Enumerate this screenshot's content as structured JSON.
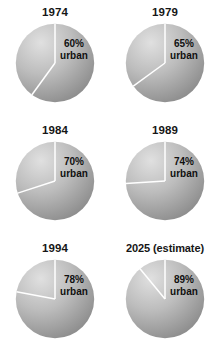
{
  "figure": {
    "background_color": "#ffffff",
    "text_color": "#161616",
    "slice_divider_color": "#ffffff",
    "gradient_light": "#e0e0e0",
    "gradient_mid": "#bdbdbd",
    "gradient_dark": "#7e7e7e"
  },
  "chart_data": {
    "type": "pie",
    "xlabel": "",
    "ylabel": "",
    "legend_position": "none",
    "grid": false,
    "units": "percent",
    "slice_labels": [
      "urban",
      "rural"
    ],
    "charts": [
      {
        "id": "pie-1974",
        "title": "1974",
        "year": "1974",
        "categories": [
          "urban",
          "rural"
        ],
        "values": [
          60,
          40
        ],
        "value_label_pct": "60%",
        "value_label_unit": "urban",
        "start_angle_deg": 0,
        "urban_sweep_deg": 216
      },
      {
        "id": "pie-1979",
        "title": "1979",
        "year": "1979",
        "categories": [
          "urban",
          "rural"
        ],
        "values": [
          65,
          35
        ],
        "value_label_pct": "65%",
        "value_label_unit": "urban",
        "start_angle_deg": 0,
        "urban_sweep_deg": 234
      },
      {
        "id": "pie-1984",
        "title": "1984",
        "year": "1984",
        "categories": [
          "urban",
          "rural"
        ],
        "values": [
          70,
          30
        ],
        "value_label_pct": "70%",
        "value_label_unit": "urban",
        "start_angle_deg": 0,
        "urban_sweep_deg": 252
      },
      {
        "id": "pie-1989",
        "title": "1989",
        "year": "1989",
        "categories": [
          "urban",
          "rural"
        ],
        "values": [
          74,
          26
        ],
        "value_label_pct": "74%",
        "value_label_unit": "urban",
        "start_angle_deg": 0,
        "urban_sweep_deg": 266.4
      },
      {
        "id": "pie-1994",
        "title": "1994",
        "year": "1994",
        "categories": [
          "urban",
          "rural"
        ],
        "values": [
          78,
          22
        ],
        "value_label_pct": "78%",
        "value_label_unit": "urban",
        "start_angle_deg": 0,
        "urban_sweep_deg": 280.8
      },
      {
        "id": "pie-2025",
        "title": "2025 (estimate)",
        "year": "2025 (estimate)",
        "categories": [
          "urban",
          "rural"
        ],
        "values": [
          89,
          11
        ],
        "value_label_pct": "89%",
        "value_label_unit": "urban",
        "start_angle_deg": 0,
        "urban_sweep_deg": 320.4
      }
    ]
  }
}
